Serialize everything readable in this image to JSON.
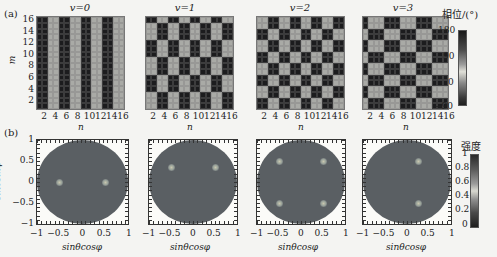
{
  "figure": {
    "panel_a_label": "(a)",
    "panel_b_label": "(b)"
  },
  "colors": {
    "dark_cell": "#1c1c1e",
    "light_cell": "#a9aaa6",
    "disk": "#5a5f63",
    "background": "#f4f4f2"
  },
  "chart_data": [
    {
      "type": "heatmap",
      "panel": "a",
      "description": "Coding phase patterns (16x16 metasurface, phase 0 or 180 deg)",
      "xlabel": "n",
      "ylabel": "m",
      "x_ticks": [
        "2",
        "4",
        "6",
        "8",
        "10",
        "12",
        "14",
        "16"
      ],
      "y_ticks": [
        "2",
        "4",
        "6",
        "8",
        "10",
        "12",
        "14",
        "16"
      ],
      "subplots": [
        {
          "title": "v=0",
          "pattern": "vertical stripes, period 4 columns (2 dark / 2 light)"
        },
        {
          "title": "v=1",
          "pattern": "2-column alternation, rows shifted in 3-row blocks"
        },
        {
          "title": "v=2",
          "pattern": "checkerboard of 2x2 blocks"
        },
        {
          "title": "v=3",
          "pattern": "2-row alternation, columns shifted in 3-column blocks"
        }
      ],
      "colorbar": {
        "title": "相位/(°)",
        "ticks": [
          "180",
          "90",
          "0",
          "−90"
        ],
        "range": [
          -90,
          180
        ]
      }
    },
    {
      "type": "heatmap",
      "panel": "b",
      "description": "Far-field scattering intensity patterns",
      "xlabel": "sinθcosφ",
      "ylabel": "sinθsinφ",
      "x_ticks": [
        "−1",
        "−0.5",
        "0",
        "0.5",
        "1"
      ],
      "y_ticks": [
        "1",
        "0.5",
        "0",
        "−0.5",
        "−1"
      ],
      "xlim": [
        -1,
        1
      ],
      "ylim": [
        -1,
        1
      ],
      "subplots": [
        {
          "title": "v=0",
          "beams": [
            [
              -0.5,
              0
            ],
            [
              0.5,
              0
            ]
          ]
        },
        {
          "title": "v=1",
          "beams": [
            [
              -0.5,
              0.35
            ],
            [
              0.5,
              0.35
            ]
          ]
        },
        {
          "title": "v=2",
          "beams": [
            [
              -0.5,
              0.5
            ],
            [
              0.5,
              0.5
            ],
            [
              -0.5,
              -0.5
            ],
            [
              0.5,
              -0.5
            ]
          ]
        },
        {
          "title": "v=3",
          "beams": [
            [
              0.25,
              0.5
            ],
            [
              0.25,
              -0.5
            ]
          ]
        }
      ],
      "colorbar": {
        "title": "强度",
        "ticks": [
          "1",
          "0.8",
          "0.6",
          "0.4",
          "0.2",
          "0"
        ],
        "range": [
          0,
          1
        ]
      }
    }
  ],
  "top": {
    "titles": [
      "v=0",
      "v=1",
      "v=2",
      "v=3"
    ],
    "ylabel": "m",
    "xlabel": "n",
    "xticks": [
      "2",
      "4",
      "6",
      "8",
      "10",
      "12",
      "14",
      "16"
    ],
    "yticks": [
      "16",
      "14",
      "12",
      "10",
      "8",
      "6",
      "4",
      "2"
    ],
    "cbar_title": "相位/(°)",
    "cbar_ticks": [
      "180",
      "90",
      "0",
      "−90"
    ]
  },
  "bottom": {
    "ylabel": "sinθsinφ",
    "xlabel": "sinθcosφ",
    "xticks": [
      "−1",
      "−0.5",
      "0",
      "0.5",
      "1"
    ],
    "yticks": [
      "1",
      "0.5",
      "0",
      "−0.5",
      "−1"
    ],
    "cbar_title": "强度",
    "cbar_ticks": [
      "1",
      "0.8",
      "0.6",
      "0.4",
      "0.2",
      "0"
    ]
  }
}
